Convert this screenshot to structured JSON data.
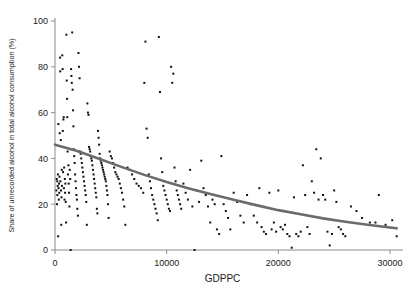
{
  "chart_data": {
    "type": "scatter",
    "title": "",
    "xlabel": "GDPPC",
    "ylabel": "Share of unrecorded alcohol in total alcohol consumption (%)",
    "xlim": [
      0,
      31500
    ],
    "ylim": [
      0,
      100
    ],
    "xticks": [
      0,
      10000,
      20000,
      30000
    ],
    "xtick_labels": [
      "0",
      "10000",
      "20000",
      "30000"
    ],
    "yticks": [
      0,
      20,
      40,
      60,
      80,
      100
    ],
    "ytick_labels": [
      "0",
      "20",
      "40",
      "60",
      "80",
      "100"
    ],
    "grid": false,
    "legend": "none",
    "marker_color": "#111111",
    "marker_size": 2.0,
    "axis_color": "#8c8c8c",
    "series": [
      {
        "name": "Countries",
        "type": "scatter",
        "points": [
          [
            120,
            26
          ],
          [
            150,
            31
          ],
          [
            180,
            20
          ],
          [
            200,
            30
          ],
          [
            210,
            24
          ],
          [
            240,
            28
          ],
          [
            260,
            33
          ],
          [
            280,
            6
          ],
          [
            300,
            55
          ],
          [
            320,
            27
          ],
          [
            340,
            22
          ],
          [
            360,
            29
          ],
          [
            380,
            25
          ],
          [
            400,
            32
          ],
          [
            420,
            51
          ],
          [
            450,
            84
          ],
          [
            470,
            78
          ],
          [
            490,
            30
          ],
          [
            520,
            48
          ],
          [
            540,
            26
          ],
          [
            560,
            11
          ],
          [
            580,
            23
          ],
          [
            600,
            35
          ],
          [
            620,
            28
          ],
          [
            650,
            85
          ],
          [
            680,
            79
          ],
          [
            700,
            52
          ],
          [
            720,
            34
          ],
          [
            750,
            57
          ],
          [
            780,
            58
          ],
          [
            800,
            27
          ],
          [
            820,
            36
          ],
          [
            850,
            22
          ],
          [
            880,
            31
          ],
          [
            900,
            25
          ],
          [
            930,
            29
          ],
          [
            960,
            21
          ],
          [
            990,
            12
          ],
          [
            1020,
            94
          ],
          [
            1050,
            74
          ],
          [
            1080,
            66
          ],
          [
            1100,
            58
          ],
          [
            1130,
            43
          ],
          [
            1160,
            33
          ],
          [
            1200,
            37
          ],
          [
            1230,
            29
          ],
          [
            1260,
            25
          ],
          [
            1290,
            19
          ],
          [
            1320,
            35
          ],
          [
            1360,
            31
          ],
          [
            1400,
            0
          ],
          [
            1440,
            79
          ],
          [
            1470,
            76
          ],
          [
            1500,
            73
          ],
          [
            1540,
            95
          ],
          [
            1580,
            70
          ],
          [
            1620,
            61
          ],
          [
            1650,
            54
          ],
          [
            1680,
            44
          ],
          [
            1720,
            41
          ],
          [
            1760,
            38
          ],
          [
            1800,
            33
          ],
          [
            1840,
            30
          ],
          [
            1880,
            27
          ],
          [
            1920,
            24
          ],
          [
            1960,
            22
          ],
          [
            2000,
            18
          ],
          [
            2050,
            15
          ],
          [
            2100,
            86
          ],
          [
            2150,
            80
          ],
          [
            2200,
            75
          ],
          [
            2250,
            43
          ],
          [
            2300,
            42
          ],
          [
            2350,
            40
          ],
          [
            2400,
            38
          ],
          [
            2450,
            36
          ],
          [
            2500,
            34
          ],
          [
            2550,
            32
          ],
          [
            2600,
            30
          ],
          [
            2650,
            28
          ],
          [
            2700,
            26
          ],
          [
            2750,
            24
          ],
          [
            2800,
            21
          ],
          [
            2850,
            11
          ],
          [
            2900,
            64
          ],
          [
            2950,
            60
          ],
          [
            3000,
            59
          ],
          [
            3050,
            45
          ],
          [
            3100,
            44
          ],
          [
            3150,
            43
          ],
          [
            3200,
            41
          ],
          [
            3250,
            40
          ],
          [
            3300,
            39
          ],
          [
            3350,
            37
          ],
          [
            3400,
            35
          ],
          [
            3450,
            33
          ],
          [
            3500,
            31
          ],
          [
            3550,
            29
          ],
          [
            3600,
            27
          ],
          [
            3650,
            25
          ],
          [
            3700,
            23
          ],
          [
            3750,
            18
          ],
          [
            3800,
            16
          ],
          [
            3850,
            52
          ],
          [
            3900,
            49
          ],
          [
            3950,
            46
          ],
          [
            4000,
            42
          ],
          [
            4050,
            40
          ],
          [
            4100,
            39
          ],
          [
            4150,
            38
          ],
          [
            4200,
            37
          ],
          [
            4250,
            36
          ],
          [
            4300,
            35
          ],
          [
            4350,
            34
          ],
          [
            4400,
            33
          ],
          [
            4450,
            32
          ],
          [
            4500,
            31
          ],
          [
            4550,
            30
          ],
          [
            4600,
            28
          ],
          [
            4650,
            26
          ],
          [
            4700,
            24
          ],
          [
            4750,
            20
          ],
          [
            4800,
            14
          ],
          [
            4900,
            43
          ],
          [
            5000,
            41
          ],
          [
            5100,
            40
          ],
          [
            5200,
            38
          ],
          [
            5300,
            36
          ],
          [
            5400,
            34
          ],
          [
            5500,
            33
          ],
          [
            5600,
            32
          ],
          [
            5700,
            31
          ],
          [
            5800,
            29
          ],
          [
            5900,
            27
          ],
          [
            6000,
            25
          ],
          [
            6100,
            22
          ],
          [
            6200,
            19
          ],
          [
            6300,
            11
          ],
          [
            6500,
            36
          ],
          [
            6700,
            35
          ],
          [
            6900,
            33
          ],
          [
            7100,
            31
          ],
          [
            7300,
            29
          ],
          [
            7500,
            28
          ],
          [
            7700,
            27
          ],
          [
            7900,
            25
          ],
          [
            8000,
            73
          ],
          [
            8100,
            91
          ],
          [
            8200,
            53
          ],
          [
            8300,
            49
          ],
          [
            8400,
            33
          ],
          [
            8500,
            30
          ],
          [
            8600,
            27
          ],
          [
            8700,
            24
          ],
          [
            8800,
            22
          ],
          [
            8900,
            20
          ],
          [
            9000,
            18
          ],
          [
            9100,
            16
          ],
          [
            9200,
            13
          ],
          [
            9300,
            93
          ],
          [
            9400,
            69
          ],
          [
            9500,
            40
          ],
          [
            9600,
            34
          ],
          [
            9700,
            28
          ],
          [
            9800,
            26
          ],
          [
            9900,
            24
          ],
          [
            10000,
            22
          ],
          [
            10100,
            20
          ],
          [
            10200,
            18
          ],
          [
            10300,
            17
          ],
          [
            10400,
            80
          ],
          [
            10500,
            73
          ],
          [
            10600,
            77
          ],
          [
            10700,
            36
          ],
          [
            10800,
            30
          ],
          [
            10900,
            26
          ],
          [
            11000,
            24
          ],
          [
            11100,
            22
          ],
          [
            11200,
            20
          ],
          [
            11300,
            18
          ],
          [
            11500,
            29
          ],
          [
            11700,
            25
          ],
          [
            11900,
            22
          ],
          [
            12100,
            35
          ],
          [
            12300,
            19
          ],
          [
            12500,
            0
          ],
          [
            12700,
            26
          ],
          [
            12900,
            21
          ],
          [
            13100,
            39
          ],
          [
            13300,
            27
          ],
          [
            13500,
            24
          ],
          [
            13700,
            19
          ],
          [
            13900,
            12
          ],
          [
            14100,
            22
          ],
          [
            14300,
            20
          ],
          [
            14500,
            9
          ],
          [
            14700,
            7
          ],
          [
            14900,
            41
          ],
          [
            15100,
            20
          ],
          [
            15300,
            17
          ],
          [
            15500,
            14
          ],
          [
            15700,
            9
          ],
          [
            16000,
            25
          ],
          [
            16300,
            21
          ],
          [
            16600,
            15
          ],
          [
            16900,
            12
          ],
          [
            17200,
            24
          ],
          [
            17500,
            20
          ],
          [
            17800,
            15
          ],
          [
            18100,
            12
          ],
          [
            18300,
            27
          ],
          [
            18500,
            10
          ],
          [
            18700,
            8
          ],
          [
            18900,
            7
          ],
          [
            19200,
            25
          ],
          [
            19400,
            9
          ],
          [
            19600,
            12
          ],
          [
            19800,
            8
          ],
          [
            20000,
            26
          ],
          [
            20200,
            10
          ],
          [
            20400,
            9
          ],
          [
            20600,
            11
          ],
          [
            20800,
            7
          ],
          [
            21000,
            6
          ],
          [
            21200,
            1
          ],
          [
            21400,
            23
          ],
          [
            21600,
            7
          ],
          [
            21800,
            6
          ],
          [
            22000,
            8
          ],
          [
            22200,
            37
          ],
          [
            22400,
            24
          ],
          [
            22600,
            10
          ],
          [
            22800,
            7
          ],
          [
            23000,
            30
          ],
          [
            23200,
            25
          ],
          [
            23400,
            44
          ],
          [
            23600,
            22
          ],
          [
            23800,
            40
          ],
          [
            24000,
            24
          ],
          [
            24200,
            22
          ],
          [
            24400,
            8
          ],
          [
            24600,
            2
          ],
          [
            24800,
            7
          ],
          [
            25000,
            26
          ],
          [
            25200,
            21
          ],
          [
            25400,
            10
          ],
          [
            25600,
            9
          ],
          [
            25800,
            7
          ],
          [
            26000,
            6
          ],
          [
            26500,
            19
          ],
          [
            27000,
            17
          ],
          [
            27500,
            14
          ],
          [
            28200,
            12
          ],
          [
            28700,
            12
          ],
          [
            29000,
            24
          ],
          [
            29600,
            11
          ],
          [
            30200,
            13
          ],
          [
            30600,
            6
          ]
        ]
      },
      {
        "name": "Fitted curve",
        "type": "line",
        "description": "Smoothed exponential-decay fit of unrecorded alcohol share on GDPPC",
        "points": [
          [
            0,
            46.0
          ],
          [
            2000,
            43.2
          ],
          [
            4000,
            39.7
          ],
          [
            6000,
            36.2
          ],
          [
            8000,
            32.8
          ],
          [
            10000,
            29.7
          ],
          [
            12000,
            26.9
          ],
          [
            14000,
            24.3
          ],
          [
            16000,
            21.9
          ],
          [
            18000,
            19.6
          ],
          [
            20000,
            17.4
          ],
          [
            22000,
            15.6
          ],
          [
            24000,
            13.8
          ],
          [
            26000,
            12.3
          ],
          [
            28000,
            11.0
          ],
          [
            30000,
            9.8
          ],
          [
            30600,
            9.5
          ]
        ]
      }
    ]
  }
}
